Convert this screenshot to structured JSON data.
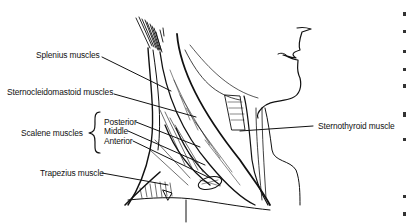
{
  "figure": {
    "type": "anatomical line illustration"
  },
  "labels": {
    "splenius": "Splenius muscles",
    "sternocleidomastoid": "Sternocleidomastoid muscles",
    "scalene_group": "Scalene muscles",
    "scalene_parts": [
      "Posterior",
      "Middle",
      "Anterior"
    ],
    "trapezius": "Trapezius muscle",
    "sternothyroid": "Sternothyroid muscle"
  },
  "colors": {
    "ink": "#111111",
    "background": "#ffffff"
  }
}
